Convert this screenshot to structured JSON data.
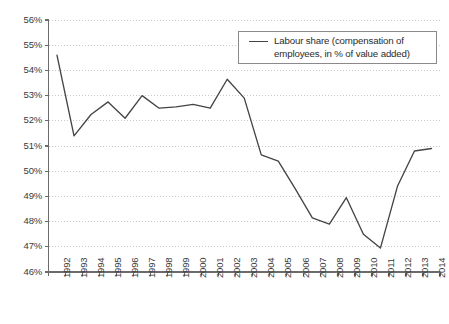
{
  "chart_data": {
    "type": "line",
    "title": "",
    "xlabel": "",
    "ylabel": "",
    "ylim": [
      46,
      56
    ],
    "ytick_step": 1,
    "ytick_labels": [
      "46%",
      "47%",
      "48%",
      "49%",
      "50%",
      "51%",
      "52%",
      "53%",
      "54%",
      "55%",
      "56%"
    ],
    "grid": "horizontal-dotted",
    "legend_position": "top-right",
    "categories": [
      "1992",
      "1993",
      "1994",
      "1995",
      "1996",
      "1997",
      "1998",
      "1999",
      "2000",
      "2001",
      "2002",
      "2003",
      "2004",
      "2005",
      "2006",
      "2007",
      "2008",
      "2009",
      "2010",
      "2011",
      "2012",
      "2013",
      "2014"
    ],
    "series": [
      {
        "name": "Labour share (compensation of employees, in % of value added)",
        "color": "#454545",
        "values": [
          54.6,
          51.4,
          52.25,
          52.75,
          52.1,
          53.0,
          52.5,
          52.55,
          52.65,
          52.5,
          53.65,
          52.9,
          50.65,
          50.4,
          49.3,
          48.15,
          47.9,
          48.95,
          47.5,
          46.95,
          49.4,
          50.8,
          50.9
        ]
      }
    ]
  },
  "legend": {
    "label": "Labour share (compensation of employees, in % of value added)"
  },
  "colors": {
    "line": "#454545",
    "axis": "#6b6b6b",
    "grid": "#c9c9c9",
    "text": "#3a3a3a",
    "background": "#ffffff"
  }
}
